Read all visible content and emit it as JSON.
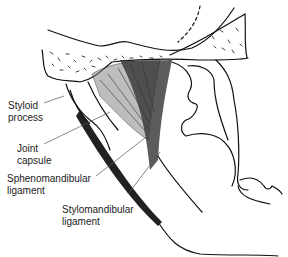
{
  "diagram": {
    "labels": [
      {
        "id": "styloid",
        "line1": "Styloid",
        "line2": "process"
      },
      {
        "id": "capsule",
        "line1": "Joint",
        "line2": "capsule"
      },
      {
        "id": "spheno",
        "line1": "Sphenomandibular",
        "line2": "ligament"
      },
      {
        "id": "stylo",
        "line1": "Stylomandibular",
        "line2": "ligament"
      }
    ],
    "colors": {
      "ink": "#111111",
      "background": "#ffffff",
      "shade": "#555555"
    }
  }
}
